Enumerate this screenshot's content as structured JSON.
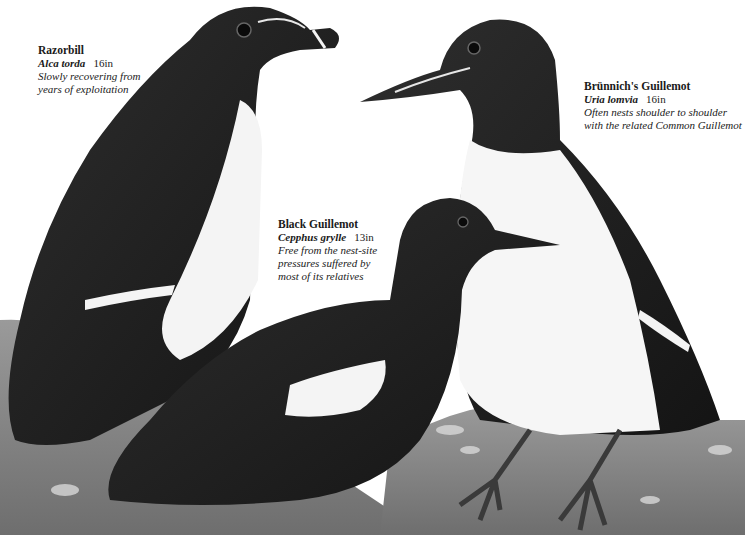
{
  "illustration": {
    "background": "#ffffff",
    "rock_color": "#8a8a8a",
    "plumage_dark": "#1c1c1c",
    "plumage_white": "#f4f4f4"
  },
  "captions": [
    {
      "id": "razorbill",
      "name": "Razorbill",
      "scientific": "Alca torda",
      "size": "16in",
      "note_lines": [
        "Slowly recovering from",
        "years of exploitation"
      ]
    },
    {
      "id": "brunnichs-guillemot",
      "name": "Brünnich's Guillemot",
      "scientific": "Uria lomvia",
      "size": "16in",
      "note_lines": [
        "Often nests shoulder to shoulder",
        "with the related Common Guillemot"
      ]
    },
    {
      "id": "black-guillemot",
      "name": "Black Guillemot",
      "scientific": "Cepphus grylle",
      "size": "13in",
      "note_lines": [
        "Free from the nest-site",
        "pressures suffered by",
        "most of its relatives"
      ]
    }
  ]
}
